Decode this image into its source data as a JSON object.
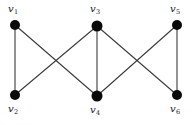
{
  "figure": {
    "background_color": "#ffffff",
    "edge_color": "#3a3a3a",
    "node_color": "#0a0a0a",
    "label_color": "#1a1a1a",
    "width": 195,
    "height": 125
  },
  "chart_data": {
    "type": "diagram",
    "diagram_kind": "undirected-graph",
    "title": "",
    "nodes": [
      {
        "id": "v1",
        "symbol": "v",
        "subscript": "1",
        "label": "v1",
        "x": 15,
        "y": 25,
        "r": 5,
        "label_x": 8,
        "label_y": 4,
        "label_position": "above-left"
      },
      {
        "id": "v2",
        "symbol": "v",
        "subscript": "2",
        "label": "v2",
        "x": 15,
        "y": 95,
        "r": 5,
        "label_x": 8,
        "label_y": 104,
        "label_position": "below-left"
      },
      {
        "id": "v3",
        "symbol": "v",
        "subscript": "3",
        "label": "v3",
        "x": 97,
        "y": 26,
        "r": 5.5,
        "label_x": 90,
        "label_y": 4,
        "label_position": "above"
      },
      {
        "id": "v4",
        "symbol": "v",
        "subscript": "4",
        "label": "v4",
        "x": 97,
        "y": 96,
        "r": 5.5,
        "label_x": 90,
        "label_y": 105,
        "label_position": "below"
      },
      {
        "id": "v5",
        "symbol": "v",
        "subscript": "5",
        "label": "v5",
        "x": 177,
        "y": 25,
        "r": 5,
        "label_x": 170,
        "label_y": 4,
        "label_position": "above"
      },
      {
        "id": "v6",
        "symbol": "v",
        "subscript": "6",
        "label": "v6",
        "x": 177,
        "y": 95,
        "r": 5,
        "label_x": 170,
        "label_y": 104,
        "label_position": "below"
      }
    ],
    "edges": [
      {
        "id": "e1",
        "source": "v1",
        "target": "v2",
        "x1": 15,
        "y1": 25,
        "x2": 15,
        "y2": 95,
        "style": "vertical-left"
      },
      {
        "id": "e2",
        "source": "v1",
        "target": "v4",
        "x1": 15,
        "y1": 25,
        "x2": 97,
        "y2": 96,
        "style": "diagonal"
      },
      {
        "id": "e3",
        "source": "v3",
        "target": "v2",
        "x1": 97,
        "y1": 26,
        "x2": 15,
        "y2": 95,
        "style": "diagonal"
      },
      {
        "id": "e4",
        "source": "v3",
        "target": "v4",
        "x1": 97,
        "y1": 26,
        "x2": 97,
        "y2": 96,
        "style": "vertical-middle"
      },
      {
        "id": "e5",
        "source": "v3",
        "target": "v6",
        "x1": 97,
        "y1": 26,
        "x2": 177,
        "y2": 95,
        "style": "diagonal"
      },
      {
        "id": "e6",
        "source": "v5",
        "target": "v4",
        "x1": 177,
        "y1": 25,
        "x2": 97,
        "y2": 96,
        "style": "diagonal"
      },
      {
        "id": "e7",
        "source": "v5",
        "target": "v6",
        "x1": 177,
        "y1": 25,
        "x2": 177,
        "y2": 95,
        "style": "vertical-right"
      }
    ],
    "node_count": 6,
    "edge_count": 7,
    "xlabel": "",
    "ylabel": "",
    "legend": []
  }
}
